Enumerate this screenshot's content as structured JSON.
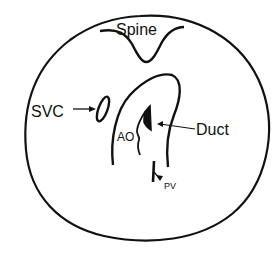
{
  "diagram": {
    "type": "anatomical cross-section schematic",
    "labels": {
      "spine": "Spine",
      "svc": "SVC",
      "duct": "Duct",
      "ao": "AO",
      "pv": "PV"
    },
    "colors": {
      "stroke": "#111111",
      "background": "#ffffff"
    }
  }
}
